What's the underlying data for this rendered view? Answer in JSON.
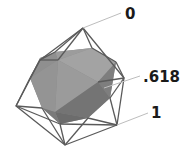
{
  "diagram": {
    "labels": [
      {
        "id": "zero",
        "text": "0",
        "x": 125,
        "y": 7
      },
      {
        "id": "golden",
        "text": ".618",
        "x": 143,
        "y": 70
      },
      {
        "id": "one",
        "text": "1",
        "x": 151,
        "y": 106
      }
    ],
    "colors": {
      "solid_light": "#9a9a9a",
      "solid_mid": "#868686",
      "solid_dark": "#6e6e6e",
      "wire": "#5a5a5a",
      "leader": "#bdbdbd",
      "text": "#1a1a1a"
    }
  }
}
